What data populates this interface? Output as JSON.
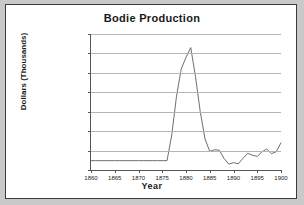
{
  "chart_data": {
    "type": "line",
    "title": "Bodie Production",
    "xlabel": "Year",
    "ylabel": "Dollars (Thousands)",
    "xlim": [
      1860,
      1900
    ],
    "ylim": [
      0,
      3500
    ],
    "xticks": [
      1860,
      1865,
      1870,
      1875,
      1880,
      1885,
      1890,
      1895,
      1900
    ],
    "yticks": [
      0,
      500,
      1000,
      1500,
      2000,
      2500,
      3000,
      3500
    ],
    "grid": true,
    "legend": "none",
    "x": [
      1860,
      1861,
      1862,
      1863,
      1864,
      1865,
      1866,
      1867,
      1868,
      1869,
      1870,
      1871,
      1872,
      1873,
      1874,
      1875,
      1876,
      1877,
      1878,
      1879,
      1880,
      1881,
      1882,
      1883,
      1884,
      1885,
      1886,
      1887,
      1888,
      1889,
      1890,
      1891,
      1892,
      1893,
      1894,
      1895,
      1896,
      1897,
      1898,
      1899,
      1900
    ],
    "values": [
      240,
      240,
      240,
      240,
      240,
      240,
      240,
      240,
      240,
      240,
      240,
      240,
      240,
      240,
      240,
      240,
      240,
      900,
      1900,
      2600,
      2900,
      3150,
      2400,
      1500,
      800,
      480,
      520,
      510,
      300,
      150,
      190,
      160,
      300,
      430,
      380,
      350,
      470,
      540,
      420,
      470,
      700
    ],
    "series_name": "Bodie Production"
  }
}
